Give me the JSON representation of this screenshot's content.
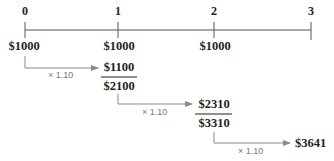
{
  "timeline": {
    "periods": [
      "0",
      "1",
      "2",
      "3"
    ],
    "deposits": [
      "$1000",
      "$1000",
      "$1000"
    ]
  },
  "steps": [
    {
      "multiplier": "× 1.10",
      "grown": "$1100",
      "sum": "$2100"
    },
    {
      "multiplier": "× 1.10",
      "grown": "$2310",
      "sum": "$3310"
    },
    {
      "multiplier": "× 1.10",
      "grown": "$3641"
    }
  ],
  "colors": {
    "text": "#231f20",
    "line": "#555555",
    "arrow": "#8a8a8a",
    "multiplier": "#7a7a7a"
  }
}
